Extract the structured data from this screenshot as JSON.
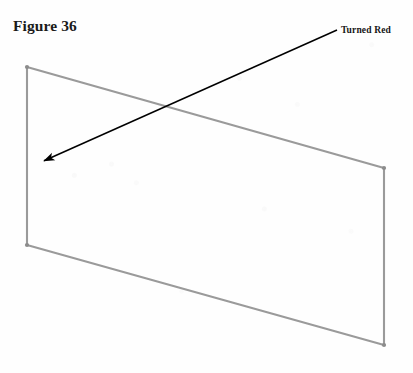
{
  "document": {
    "caption": "Figure 36",
    "background_color": "#fefefe"
  },
  "annotation": {
    "label": "Turned Red",
    "label_color": "#161616",
    "pointer_color": "#000000",
    "pointer": {
      "tail_x": 337,
      "tail_y": 30,
      "tip_x": 39,
      "tip_y": 163
    }
  },
  "figure": {
    "shape_name": "quadrilateral-panel",
    "stroke_color": "#9a9a9a",
    "stroke_width": 2,
    "vertex_color": "#8c8c8c",
    "vertices": [
      {
        "name": "top-left",
        "x": 27,
        "y": 67
      },
      {
        "name": "top-right",
        "x": 384,
        "y": 168
      },
      {
        "name": "bottom-right",
        "x": 384,
        "y": 345
      },
      {
        "name": "bottom-left",
        "x": 27,
        "y": 245
      }
    ],
    "edges": [
      {
        "name": "top-edge",
        "from": "top-left",
        "to": "top-right"
      },
      {
        "name": "right-edge",
        "from": "top-right",
        "to": "bottom-right"
      },
      {
        "name": "bottom-edge",
        "from": "bottom-right",
        "to": "bottom-left"
      },
      {
        "name": "left-edge",
        "from": "bottom-left",
        "to": "top-left"
      }
    ]
  }
}
